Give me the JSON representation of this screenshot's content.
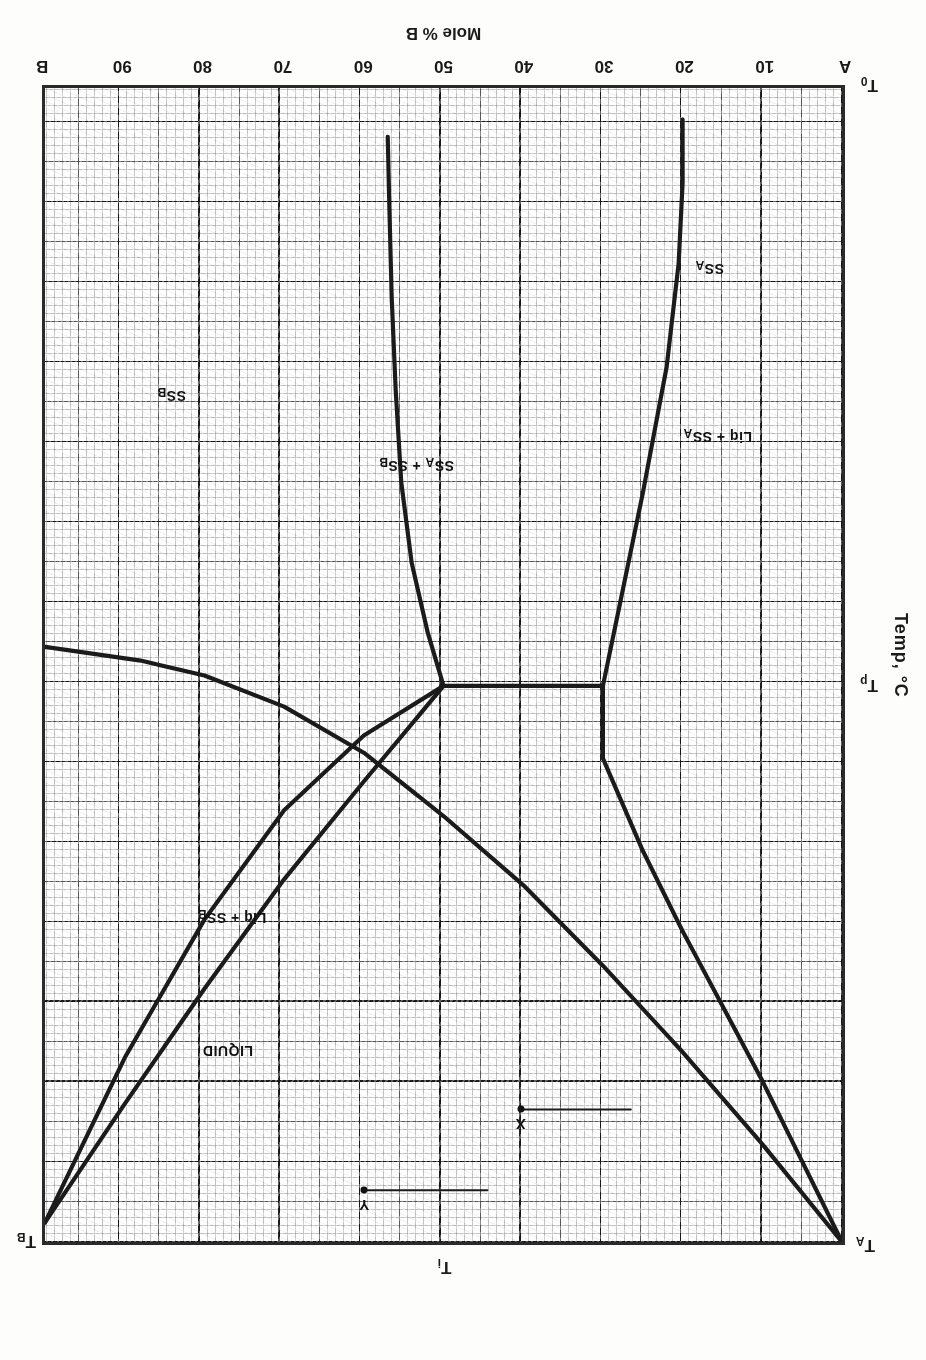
{
  "figure": {
    "orientation_note": "scanned-upside-down",
    "axis": {
      "x_title": "Mole % B",
      "x_ticks": [
        "A",
        "10",
        "20",
        "30",
        "40",
        "50",
        "60",
        "70",
        "80",
        "90",
        "B"
      ],
      "x_tick_values": [
        0,
        10,
        20,
        30,
        40,
        50,
        60,
        70,
        80,
        90,
        100
      ],
      "y_title": "Temp, °C",
      "y_marks": [
        {
          "id": "T0",
          "base": "T",
          "sub": "0",
          "value": 0
        },
        {
          "id": "Tp",
          "base": "T",
          "sub": "p",
          "value": 51.7
        },
        {
          "id": "Ti",
          "base": "T",
          "sub": "i",
          "value": 100
        },
        {
          "id": "TA",
          "base": "T",
          "sub": "A",
          "value": 100
        },
        {
          "id": "TB",
          "base": "T",
          "sub": "B",
          "value": 98.3
        }
      ]
    },
    "regions": [
      {
        "id": "liquid",
        "text": "LIQUID",
        "x": 76.5,
        "y": 83.5
      },
      {
        "id": "liq-ssa",
        "text": "Liq + SS A",
        "x": 15.5,
        "y": 30.5
      },
      {
        "id": "liq-ssb",
        "text": "Liq + SS B",
        "x": 76.0,
        "y": 72.0
      },
      {
        "id": "ssa",
        "text": "SS A",
        "x": 16.5,
        "y": 16.0
      },
      {
        "id": "ssb",
        "text": "SS B",
        "x": 83.5,
        "y": 27.0
      },
      {
        "id": "ssa-ssb",
        "text": "SS A + SS B",
        "x": 53.0,
        "y": 33.0
      }
    ],
    "points": [
      {
        "id": "X",
        "label": "X",
        "x": 40.0,
        "y": 88.5
      },
      {
        "id": "Y",
        "label": "Y",
        "x": 59.5,
        "y": 95.5
      }
    ]
  },
  "chart_data": {
    "type": "line",
    "xlabel": "Mole % B",
    "ylabel": "Temp, °C",
    "xlim": [
      0,
      100
    ],
    "ylim": [
      0,
      100
    ],
    "grid": true,
    "legend": "none",
    "xtick_labels": [
      "A",
      "10",
      "20",
      "30",
      "40",
      "50",
      "60",
      "70",
      "80",
      "90",
      "B"
    ],
    "ytick_labels": [
      "T0",
      "Tp",
      "Ti"
    ],
    "annotations": [
      "LIQUID",
      "Liq + SS A",
      "Liq + SS B",
      "SS A",
      "SS B",
      "SS A + SS B",
      "TA",
      "TB",
      "Tp",
      "Ti",
      "T0",
      "X",
      "Y"
    ],
    "series": [
      {
        "name": "liquidus A-side (TA to peritectic liquid)",
        "points": [
          [
            0,
            100
          ],
          [
            10,
            91.5
          ],
          [
            20,
            83.5
          ],
          [
            30,
            76.0
          ],
          [
            40,
            69.0
          ],
          [
            50,
            63.0
          ],
          [
            60,
            57.5
          ],
          [
            70,
            53.5
          ],
          [
            80,
            50.8
          ],
          [
            88,
            49.5
          ],
          [
            100,
            48.3
          ]
        ]
      },
      {
        "name": "solidus SS_A (TA to peritectic)",
        "points": [
          [
            0,
            100
          ],
          [
            5,
            93.0
          ],
          [
            10,
            86.0
          ],
          [
            15,
            79.5
          ],
          [
            20,
            73.0
          ],
          [
            25,
            66.0
          ],
          [
            30,
            58.0
          ],
          [
            30,
            51.7
          ]
        ]
      },
      {
        "name": "peritectic horizontal line",
        "points": [
          [
            30,
            51.7
          ],
          [
            50,
            51.7
          ]
        ]
      },
      {
        "name": "solvus SS_A boundary (peritectic down to T0 side)",
        "points": [
          [
            30,
            51.7
          ],
          [
            28,
            45.0
          ],
          [
            25,
            35.0
          ],
          [
            22,
            24.0
          ],
          [
            20.5,
            15.0
          ],
          [
            20,
            8.0
          ],
          [
            20,
            2.5
          ]
        ]
      },
      {
        "name": "solvus SS_B boundary",
        "points": [
          [
            50,
            51.7
          ],
          [
            52,
            47.0
          ],
          [
            54,
            41.0
          ],
          [
            55.3,
            34.0
          ],
          [
            56,
            26.0
          ],
          [
            56.5,
            18.0
          ],
          [
            56.8,
            10.0
          ],
          [
            57,
            4.0
          ]
        ]
      },
      {
        "name": "liquidus B-side (peritectic liquid to TB)",
        "points": [
          [
            50,
            51.7
          ],
          [
            60,
            60.0
          ],
          [
            70,
            68.5
          ],
          [
            80,
            78.0
          ],
          [
            90,
            88.0
          ],
          [
            100,
            98.3
          ]
        ]
      },
      {
        "name": "solidus SS_B (peritectic to TB)",
        "points": [
          [
            50,
            51.7
          ],
          [
            60,
            56.0
          ],
          [
            70,
            62.5
          ],
          [
            80,
            72.0
          ],
          [
            90,
            84.0
          ],
          [
            100,
            98.3
          ]
        ]
      }
    ],
    "tie_lines": [
      {
        "name": "tie-line through X",
        "points": [
          [
            26.5,
            88.5
          ],
          [
            40,
            88.5
          ]
        ]
      },
      {
        "name": "tie-line through Y",
        "points": [
          [
            44.5,
            95.5
          ],
          [
            59.5,
            95.5
          ]
        ]
      }
    ]
  }
}
